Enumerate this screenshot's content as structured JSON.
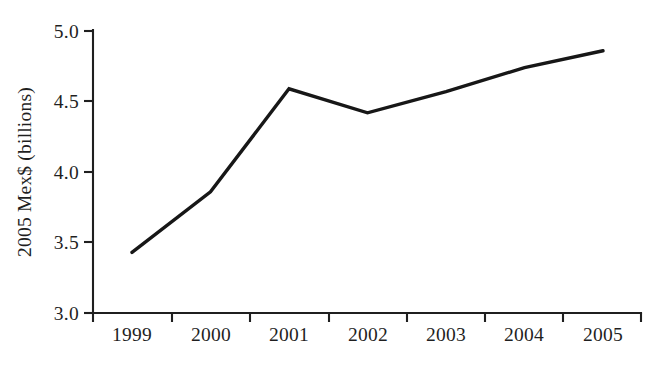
{
  "chart_data": {
    "type": "line",
    "title": "",
    "subtitle": "",
    "xlabel": "",
    "ylabel": "2005 Mex$ (billions)",
    "categories": [
      "1999",
      "2000",
      "2001",
      "2002",
      "2003",
      "2004",
      "2005"
    ],
    "x": [
      1999,
      2000,
      2001,
      2002,
      2003,
      2004,
      2005
    ],
    "values": [
      3.43,
      3.86,
      4.59,
      4.42,
      4.57,
      4.74,
      4.86
    ],
    "series": [
      {
        "name": "",
        "values": [
          3.43,
          3.86,
          4.59,
          4.42,
          4.57,
          4.74,
          4.86
        ]
      }
    ],
    "ylim": [
      3.0,
      5.0
    ],
    "ytick_labels": [
      "3.0",
      "3.5",
      "4.0",
      "4.5",
      "5.0"
    ],
    "ytick_values": [
      3.0,
      3.5,
      4.0,
      4.5,
      5.0
    ],
    "xtick_labels": [
      "1999",
      "2000",
      "2001",
      "2002",
      "2003",
      "2004",
      "2005"
    ],
    "grid": false,
    "legend": false,
    "legend_position": "none",
    "line_color": "#171717",
    "axis_color": "#1f1f1f",
    "background_color": "#ffffff",
    "annotations": []
  },
  "axis": {
    "y_title": "2005 Mex$ (billions)"
  }
}
